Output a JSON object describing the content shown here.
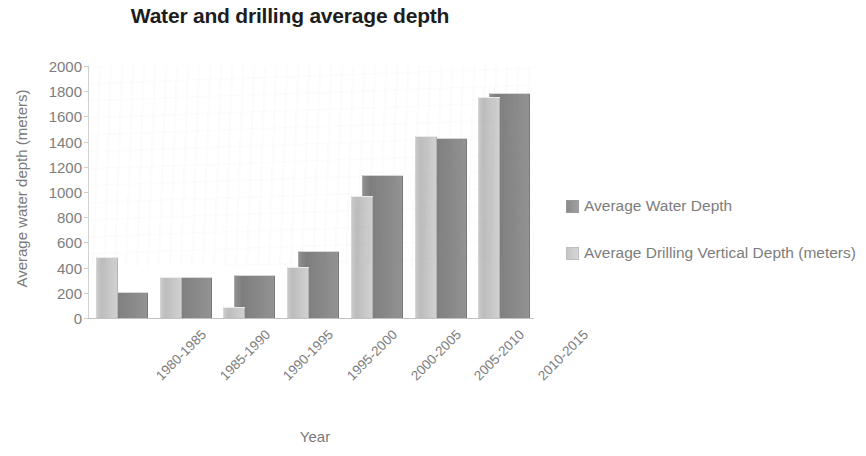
{
  "chart_data": {
    "type": "bar",
    "title": "Water and drilling average depth",
    "xlabel": "Year",
    "ylabel": "Average water depth (meters)",
    "categories": [
      "1980-1985",
      "1985-1990",
      "1990-1995",
      "1995-2000",
      "2000-2005",
      "2005-2010",
      "2010-2015"
    ],
    "series": [
      {
        "name": "Average Water Depth",
        "color": "#8f8f8f",
        "values": [
          200,
          320,
          330,
          520,
          1130,
          1420,
          1780
        ]
      },
      {
        "name": "Average Drilling Vertical Depth (meters)",
        "color": "#c9c9c9",
        "values": [
          480,
          320,
          80,
          400,
          960,
          1440,
          1750
        ]
      }
    ],
    "ylim": [
      0,
      2000
    ],
    "yticks": [
      0,
      200,
      400,
      600,
      800,
      1000,
      1200,
      1400,
      1600,
      1800,
      2000
    ],
    "ytick_labels": [
      "0",
      "200",
      "400",
      "600",
      "800",
      "1000",
      "1200",
      "1400",
      "1600",
      "1800",
      "2000"
    ],
    "grid": false,
    "legend_position": "right",
    "xtick_rotation": -45
  },
  "legend": {
    "entries": [
      {
        "label": "Average Water Depth",
        "swatch": "dark"
      },
      {
        "label": "Average Drilling Vertical Depth (meters)",
        "swatch": "light"
      }
    ]
  }
}
